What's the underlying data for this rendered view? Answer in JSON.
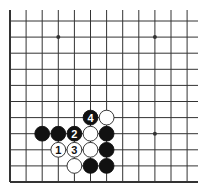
{
  "diagram": {
    "type": "go-board-partial",
    "grid": {
      "columns": 12,
      "rows": 11,
      "origin_x": 10,
      "origin_y": 21,
      "spacing": 16.1,
      "top_y": 10,
      "right_x": 198,
      "left_edge_bold": true,
      "bottom_edge_bold": true
    },
    "colors": {
      "background": "#ffffff",
      "line": "#333333",
      "black_stone": "#111111",
      "white_stone": "#ffffff",
      "white_stroke": "#222222"
    },
    "star_points": [
      {
        "col": 3,
        "row": 1
      },
      {
        "col": 9,
        "row": 1
      },
      {
        "col": 9,
        "row": 7
      }
    ],
    "stones": [
      {
        "color": "black",
        "col": 5,
        "row": 6,
        "label": "4"
      },
      {
        "color": "white",
        "col": 6,
        "row": 6,
        "label": ""
      },
      {
        "color": "black",
        "col": 2,
        "row": 7,
        "label": ""
      },
      {
        "color": "black",
        "col": 3,
        "row": 7,
        "label": ""
      },
      {
        "color": "black",
        "col": 4,
        "row": 7,
        "label": "2"
      },
      {
        "color": "white",
        "col": 5,
        "row": 7,
        "label": ""
      },
      {
        "color": "black",
        "col": 6,
        "row": 7,
        "label": ""
      },
      {
        "color": "white",
        "col": 3,
        "row": 8,
        "label": "1"
      },
      {
        "color": "white",
        "col": 4,
        "row": 8,
        "label": "3"
      },
      {
        "color": "white",
        "col": 5,
        "row": 8,
        "label": ""
      },
      {
        "color": "black",
        "col": 6,
        "row": 8,
        "label": ""
      },
      {
        "color": "white",
        "col": 4,
        "row": 9,
        "label": ""
      },
      {
        "color": "black",
        "col": 5,
        "row": 9,
        "label": ""
      },
      {
        "color": "black",
        "col": 6,
        "row": 9,
        "label": ""
      }
    ]
  }
}
